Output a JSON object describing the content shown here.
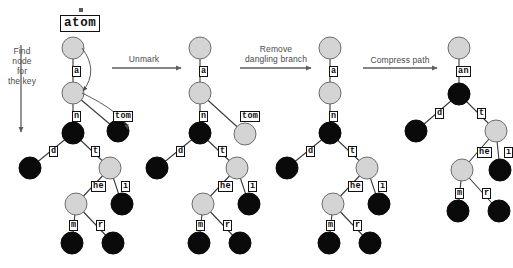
{
  "diagram": {
    "title_key": "atom",
    "key_mark": "mark-tick",
    "steps": [
      {
        "id": "find",
        "label": "Find\nnode\nfor\nthe key",
        "orientation": "vertical"
      },
      {
        "id": "unmark",
        "label": "Unmark",
        "orientation": "horizontal"
      },
      {
        "id": "remove",
        "label": "Remove\ndangling branch",
        "orientation": "horizontal"
      },
      {
        "id": "compress",
        "label": "Compress path",
        "orientation": "horizontal"
      }
    ],
    "colors": {
      "marked_node": "#0a0a0a",
      "unmarked_node": "#d4d4d4",
      "node_stroke": "#6d6d6d",
      "edge": "#3a3a3a",
      "arrow": "#5e5e5e",
      "label_text": "#4a4a4a",
      "box_text": "#0d0d0d",
      "background": "#ffffff"
    },
    "trees": [
      {
        "id": "tree-1",
        "caption": "after find",
        "nodes": [
          {
            "id": "t1-root",
            "x": 73,
            "y": 48,
            "r": 11,
            "state": "unmarked"
          },
          {
            "id": "t1-a",
            "x": 73,
            "y": 93,
            "r": 11,
            "state": "unmarked"
          },
          {
            "id": "t1-n",
            "x": 73,
            "y": 133,
            "r": 11,
            "state": "marked"
          },
          {
            "id": "t1-tom",
            "x": 118,
            "y": 131,
            "r": 11,
            "state": "marked"
          },
          {
            "id": "t1-d",
            "x": 30,
            "y": 168,
            "r": 11,
            "state": "marked"
          },
          {
            "id": "t1-t",
            "x": 110,
            "y": 168,
            "r": 11,
            "state": "unmarked"
          },
          {
            "id": "t1-i",
            "x": 122,
            "y": 204,
            "r": 11,
            "state": "marked"
          },
          {
            "id": "t1-he",
            "x": 76,
            "y": 204,
            "r": 11,
            "state": "unmarked"
          },
          {
            "id": "t1-m",
            "x": 72,
            "y": 243,
            "r": 11,
            "state": "marked"
          },
          {
            "id": "t1-r",
            "x": 113,
            "y": 243,
            "r": 11,
            "state": "marked"
          }
        ],
        "edges": [
          {
            "from": "t1-root",
            "to": "t1-a",
            "label": "a",
            "lx": 73,
            "ly": 71
          },
          {
            "from": "t1-a",
            "to": "t1-n",
            "label": "n",
            "lx": 73,
            "ly": 116
          },
          {
            "from": "t1-a",
            "to": "t1-tom",
            "label": "tom",
            "lx": 114,
            "ly": 116
          },
          {
            "from": "t1-n",
            "to": "t1-d",
            "label": "d",
            "lx": 50,
            "ly": 151
          },
          {
            "from": "t1-n",
            "to": "t1-t",
            "label": "t",
            "lx": 92,
            "ly": 151
          },
          {
            "from": "t1-t",
            "to": "t1-he",
            "label": "he",
            "lx": 92,
            "ly": 186
          },
          {
            "from": "t1-t",
            "to": "t1-i",
            "label": "i",
            "lx": 122,
            "ly": 186
          },
          {
            "from": "t1-he",
            "to": "t1-m",
            "label": "m",
            "lx": 70,
            "ly": 225
          },
          {
            "from": "t1-he",
            "to": "t1-r",
            "label": "r",
            "lx": 97,
            "ly": 225
          }
        ],
        "search_arrows": [
          {
            "from": "t1-root",
            "to": "t1-a"
          },
          {
            "from": "t1-a",
            "to": "t1-tom"
          }
        ]
      },
      {
        "id": "tree-2",
        "caption": "after unmark",
        "nodes": [
          {
            "id": "t2-root",
            "x": 200,
            "y": 48,
            "r": 11,
            "state": "unmarked"
          },
          {
            "id": "t2-a",
            "x": 200,
            "y": 93,
            "r": 11,
            "state": "unmarked"
          },
          {
            "id": "t2-n",
            "x": 200,
            "y": 133,
            "r": 11,
            "state": "marked"
          },
          {
            "id": "t2-tom",
            "x": 245,
            "y": 134,
            "r": 11,
            "state": "unmarked"
          },
          {
            "id": "t2-d",
            "x": 157,
            "y": 168,
            "r": 11,
            "state": "marked"
          },
          {
            "id": "t2-t",
            "x": 237,
            "y": 168,
            "r": 11,
            "state": "unmarked"
          },
          {
            "id": "t2-i",
            "x": 249,
            "y": 204,
            "r": 11,
            "state": "marked"
          },
          {
            "id": "t2-he",
            "x": 203,
            "y": 204,
            "r": 11,
            "state": "unmarked"
          },
          {
            "id": "t2-m",
            "x": 199,
            "y": 243,
            "r": 11,
            "state": "marked"
          },
          {
            "id": "t2-r",
            "x": 240,
            "y": 243,
            "r": 11,
            "state": "marked"
          }
        ],
        "edges": [
          {
            "from": "t2-root",
            "to": "t2-a",
            "label": "a",
            "lx": 200,
            "ly": 71
          },
          {
            "from": "t2-a",
            "to": "t2-n",
            "label": "n",
            "lx": 200,
            "ly": 116
          },
          {
            "from": "t2-a",
            "to": "t2-tom",
            "label": "tom",
            "lx": 241,
            "ly": 116
          },
          {
            "from": "t2-n",
            "to": "t2-d",
            "label": "d",
            "lx": 177,
            "ly": 151
          },
          {
            "from": "t2-n",
            "to": "t2-t",
            "label": "t",
            "lx": 219,
            "ly": 151
          },
          {
            "from": "t2-t",
            "to": "t2-he",
            "label": "he",
            "lx": 219,
            "ly": 186
          },
          {
            "from": "t2-t",
            "to": "t2-i",
            "label": "i",
            "lx": 249,
            "ly": 186
          },
          {
            "from": "t2-he",
            "to": "t2-m",
            "label": "m",
            "lx": 197,
            "ly": 225
          },
          {
            "from": "t2-he",
            "to": "t2-r",
            "label": "r",
            "lx": 224,
            "ly": 225
          }
        ],
        "search_arrows": []
      },
      {
        "id": "tree-3",
        "caption": "after remove dangling branch",
        "nodes": [
          {
            "id": "t3-root",
            "x": 330,
            "y": 48,
            "r": 11,
            "state": "unmarked"
          },
          {
            "id": "t3-a",
            "x": 330,
            "y": 93,
            "r": 11,
            "state": "unmarked"
          },
          {
            "id": "t3-n",
            "x": 330,
            "y": 133,
            "r": 11,
            "state": "marked"
          },
          {
            "id": "t3-d",
            "x": 287,
            "y": 168,
            "r": 11,
            "state": "marked"
          },
          {
            "id": "t3-t",
            "x": 367,
            "y": 168,
            "r": 11,
            "state": "unmarked"
          },
          {
            "id": "t3-i",
            "x": 379,
            "y": 204,
            "r": 11,
            "state": "marked"
          },
          {
            "id": "t3-he",
            "x": 333,
            "y": 204,
            "r": 11,
            "state": "unmarked"
          },
          {
            "id": "t3-m",
            "x": 329,
            "y": 243,
            "r": 11,
            "state": "marked"
          },
          {
            "id": "t3-r",
            "x": 370,
            "y": 243,
            "r": 11,
            "state": "marked"
          }
        ],
        "edges": [
          {
            "from": "t3-root",
            "to": "t3-a",
            "label": "a",
            "lx": 330,
            "ly": 71
          },
          {
            "from": "t3-a",
            "to": "t3-n",
            "label": "n",
            "lx": 330,
            "ly": 116
          },
          {
            "from": "t3-n",
            "to": "t3-d",
            "label": "d",
            "lx": 307,
            "ly": 151
          },
          {
            "from": "t3-n",
            "to": "t3-t",
            "label": "t",
            "lx": 349,
            "ly": 151
          },
          {
            "from": "t3-t",
            "to": "t3-he",
            "label": "he",
            "lx": 349,
            "ly": 186
          },
          {
            "from": "t3-t",
            "to": "t3-i",
            "label": "i",
            "lx": 379,
            "ly": 186
          },
          {
            "from": "t3-he",
            "to": "t3-m",
            "label": "m",
            "lx": 327,
            "ly": 225
          },
          {
            "from": "t3-he",
            "to": "t3-r",
            "label": "r",
            "lx": 354,
            "ly": 225
          }
        ],
        "search_arrows": []
      },
      {
        "id": "tree-4",
        "caption": "after compress path",
        "nodes": [
          {
            "id": "t4-root",
            "x": 459,
            "y": 48,
            "r": 11,
            "state": "unmarked"
          },
          {
            "id": "t4-n",
            "x": 459,
            "y": 94,
            "r": 11,
            "state": "marked"
          },
          {
            "id": "t4-d",
            "x": 416,
            "y": 131,
            "r": 11,
            "state": "marked"
          },
          {
            "id": "t4-t",
            "x": 496,
            "y": 131,
            "r": 11,
            "state": "unmarked"
          },
          {
            "id": "t4-i",
            "x": 500,
            "y": 170,
            "r": 11,
            "state": "marked"
          },
          {
            "id": "t4-he",
            "x": 462,
            "y": 170,
            "r": 11,
            "state": "unmarked"
          },
          {
            "id": "t4-m",
            "x": 458,
            "y": 211,
            "r": 11,
            "state": "marked"
          },
          {
            "id": "t4-r",
            "x": 499,
            "y": 211,
            "r": 11,
            "state": "marked"
          }
        ],
        "edges": [
          {
            "from": "t4-root",
            "to": "t4-n",
            "label": "an",
            "lx": 457,
            "ly": 71
          },
          {
            "from": "t4-n",
            "to": "t4-d",
            "label": "d",
            "lx": 436,
            "ly": 113
          },
          {
            "from": "t4-n",
            "to": "t4-t",
            "label": "t",
            "lx": 478,
            "ly": 113
          },
          {
            "from": "t4-t",
            "to": "t4-he",
            "label": "he",
            "lx": 478,
            "ly": 152
          },
          {
            "from": "t4-t",
            "to": "t4-i",
            "label": "i",
            "lx": 505,
            "ly": 152
          },
          {
            "from": "t4-he",
            "to": "t4-m",
            "label": "m",
            "lx": 456,
            "ly": 193
          },
          {
            "from": "t4-he",
            "to": "t4-r",
            "label": "r",
            "lx": 483,
            "ly": 193
          }
        ],
        "search_arrows": []
      }
    ]
  }
}
